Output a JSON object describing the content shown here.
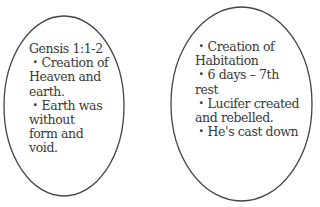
{
  "diagram": {
    "ellipses": [
      {
        "name": "left-ellipse",
        "stroke": "#444444",
        "lines": [
          "Gensis 1:1-2",
          "・Creation of",
          "Heaven and",
          "earth.",
          "・Earth was",
          "without",
          "form and",
          "void."
        ]
      },
      {
        "name": "right-ellipse",
        "stroke": "#444444",
        "lines": [
          "・Creation of",
          "Habitation",
          "・6 days – 7th",
          "rest",
          "・Lucifer created",
          "and rebelled.",
          "・He's cast down"
        ]
      }
    ]
  }
}
